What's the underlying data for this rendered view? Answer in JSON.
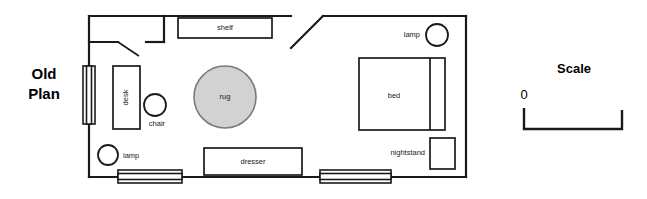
{
  "title": {
    "line1": "Old",
    "line2": "Plan"
  },
  "scale": {
    "label": "Scale",
    "zero": "0"
  },
  "colors": {
    "ink": "#1a1a1a",
    "rug_fill": "#d2d2d2",
    "rug_stroke": "#7a7a7a",
    "background": "#ffffff"
  },
  "room": {
    "name": "bedroom-floor-plan"
  },
  "furniture": [
    {
      "id": "shelf",
      "label": "shelf",
      "label_position": "inside"
    },
    {
      "id": "desk",
      "label": "desk",
      "label_position": "inside-rotated"
    },
    {
      "id": "chair",
      "label": "chair",
      "label_position": "below"
    },
    {
      "id": "rug",
      "label": "rug",
      "label_position": "inside"
    },
    {
      "id": "dresser",
      "label": "dresser",
      "label_position": "inside"
    },
    {
      "id": "bed",
      "label": "bed",
      "label_position": "inside"
    },
    {
      "id": "nightstand",
      "label": "nightstand",
      "label_position": "left"
    },
    {
      "id": "lamp-top-right",
      "label": "lamp",
      "label_position": "left"
    },
    {
      "id": "lamp-bottom-left",
      "label": "lamp",
      "label_position": "right"
    }
  ],
  "fixtures": [
    {
      "id": "window-left",
      "type": "window"
    },
    {
      "id": "window-bottom-left",
      "type": "window"
    },
    {
      "id": "window-bottom-right",
      "type": "window"
    },
    {
      "id": "closet",
      "type": "closet"
    },
    {
      "id": "closet-door",
      "type": "door-swing"
    },
    {
      "id": "angled-wall",
      "type": "diagonal-wall"
    }
  ]
}
